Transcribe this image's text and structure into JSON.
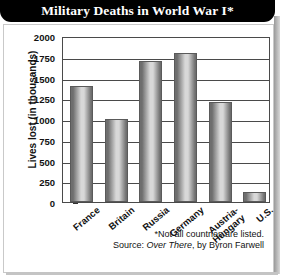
{
  "title": "Military Deaths in World War I*",
  "footnotes": {
    "asterisk_note": "*Not all countries are listed.",
    "source_prefix": "Source:",
    "source_title": "Over There",
    "source_suffix": ", by Byron Farwell"
  },
  "axis": {
    "y_label": "Lives lost (in thousands)",
    "y_ticks": [
      "2000",
      "1750",
      "1500",
      "1250",
      "1000",
      "750",
      "500",
      "250",
      "0"
    ]
  },
  "colors": {
    "title_bar": "#000000",
    "title_text": "#ffffff",
    "bar_dark_edge": "#6e6e6e",
    "bar_light_center": "#d8d8d8",
    "axis_line": "#4a4a4a",
    "frame": "#c9c9c9"
  },
  "chart_data": {
    "type": "bar",
    "title": "Military Deaths in World War I*",
    "xlabel": "",
    "ylabel": "Lives lost (in thousands)",
    "ylim": [
      0,
      2000
    ],
    "ytick_step": 250,
    "grid": true,
    "legend": "none",
    "categories": [
      "France",
      "Britain",
      "Russia",
      "Germany",
      "Austria-Hungary",
      "U.S."
    ],
    "values": [
      1400,
      1000,
      1700,
      1800,
      1200,
      115
    ],
    "units": "thousands of lives lost",
    "notes": "*Not all countries are listed. Source: Over There, by Byron Farwell"
  }
}
